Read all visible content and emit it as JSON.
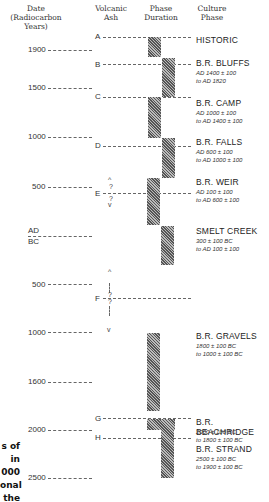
{
  "headers": {
    "date": "Date\n(Radiocarbon Years)",
    "date_line1": "Date",
    "date_line2": "(Radiocarbon Years)",
    "ash_line1": "Volcanic",
    "ash_line2": "Ash",
    "phase_line1": "Phase",
    "phase_line2": "Duration",
    "culture_line1": "Culture",
    "culture_line2": "Phase"
  },
  "date_ticks": [
    {
      "label": "1900",
      "y": 50
    },
    {
      "label": "1500",
      "y": 87
    },
    {
      "label": "1000",
      "y": 137
    },
    {
      "label": "500",
      "y": 187
    },
    {
      "label_ad": "AD",
      "label_bc": "BC",
      "y": 236
    },
    {
      "label": "500",
      "y": 284
    },
    {
      "label": "1000",
      "y": 332
    },
    {
      "label": "1600",
      "y": 382
    },
    {
      "label": "2000",
      "y": 430
    },
    {
      "label": "2500",
      "y": 478
    }
  ],
  "ash_markers": [
    {
      "label": "A",
      "y": 37
    },
    {
      "label": "B",
      "y": 64
    },
    {
      "label": "C",
      "y": 97
    },
    {
      "label": "D",
      "y": 146
    },
    {
      "label": "E",
      "y": 193
    },
    {
      "label": "F",
      "y": 298
    },
    {
      "label": "G",
      "y": 418
    },
    {
      "label": "H",
      "y": 438
    }
  ],
  "uncertainty_symbols": {
    "up_caret": "^",
    "down_caret": "v",
    "question": "?"
  },
  "phases": [
    {
      "name": "HISTORIC",
      "range1": "",
      "range2": ""
    },
    {
      "name": "B.R. BLUFFS",
      "range1": "AD 1400 ± 100",
      "range2": "to AD 1820"
    },
    {
      "name": "B.R. CAMP",
      "range1": "AD 1000 ± 100",
      "range2": "to AD 1400 ± 100"
    },
    {
      "name": "B.R. FALLS",
      "range1": "AD 600 ± 100",
      "range2": "to AD 1000 ± 100"
    },
    {
      "name": "B.R. WEIR",
      "range1": "AD 100 ± 100",
      "range2": "to AD 600 ± 100"
    },
    {
      "name": "SMELT CREEK",
      "range1": "300 ± 100 BC",
      "range2": "to AD 100 ± 100"
    },
    {
      "name": "B.R. GRAVELS",
      "range1": "1800 ± 100 BC",
      "range2": "to 1000 ± 100 BC"
    },
    {
      "name": "B.R. BEACHRIDGE",
      "range1": "2000 ± 100 BC",
      "range2": "to 1800 ± 100 BC"
    },
    {
      "name": "B.R. STRAND",
      "range1": "2500 ± 100 BC",
      "range2": "to 1900 ± 100 BC"
    }
  ],
  "caption_fragments": [
    "s of",
    "in",
    "000",
    "onal",
    "the"
  ],
  "colors": {
    "bar_dark": "#555555",
    "bar_light": "#bbbbbb",
    "text": "#222222",
    "dash": "#666666"
  }
}
